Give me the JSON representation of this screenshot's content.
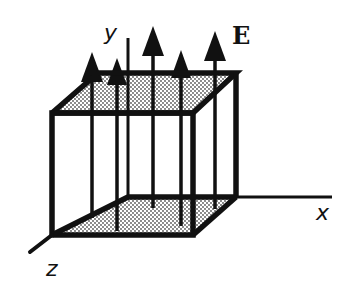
{
  "diagram": {
    "labels": {
      "y_axis": "y",
      "x_axis": "x",
      "z_axis": "z",
      "field": "E"
    },
    "colors": {
      "stroke": "#111111",
      "shading": "#c8c8c8",
      "background": "#ffffff"
    },
    "arrows": [
      {
        "x": 92,
        "top": 57,
        "bottom": 218
      },
      {
        "x": 117,
        "top": 61,
        "bottom": 231
      },
      {
        "x": 153,
        "top": 28,
        "bottom": 208
      },
      {
        "x": 181,
        "top": 52,
        "bottom": 226
      },
      {
        "x": 215,
        "top": 32,
        "bottom": 209
      }
    ]
  }
}
